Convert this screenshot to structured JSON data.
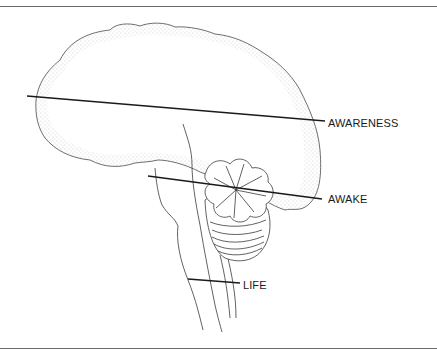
{
  "diagram": {
    "type": "brain-levels-sagittal",
    "labels": {
      "awareness": "AWARENESS",
      "awake": "AWAKE",
      "life": "LIFE"
    },
    "colors": {
      "line": "#1a1a1a",
      "outline": "#4a4a4a",
      "stipple": "#b8b8b8",
      "rule": "#6a6a6a"
    }
  }
}
